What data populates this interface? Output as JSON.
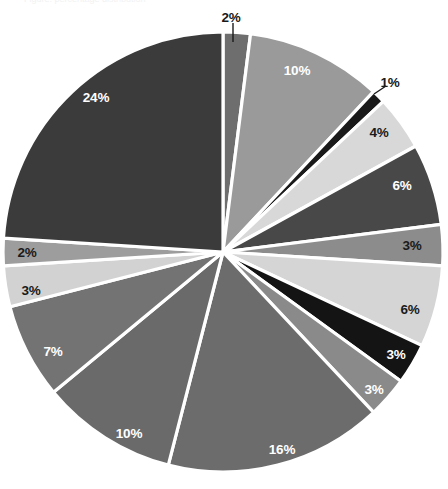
{
  "chart_data": {
    "type": "pie",
    "title": "",
    "subtitle": "",
    "xlabel": "",
    "ylabel": "",
    "legend": "none",
    "grid": false,
    "start_angle_deg": 0,
    "direction": "clockwise",
    "units": "percent",
    "total": 100,
    "center": {
      "x": 223,
      "y": 252
    },
    "radius": 220,
    "separator_color": "#ffffff",
    "background": "#ffffff",
    "categories": [
      "slice-1",
      "slice-2",
      "slice-3",
      "slice-4",
      "slice-5",
      "slice-6",
      "slice-7",
      "slice-8",
      "slice-9",
      "slice-10",
      "slice-11",
      "slice-12",
      "slice-13",
      "slice-14",
      "slice-15"
    ],
    "values": [
      2,
      10,
      1,
      4,
      6,
      3,
      6,
      3,
      3,
      16,
      10,
      7,
      3,
      2,
      24
    ],
    "labels": [
      "2%",
      "10%",
      "1%",
      "4%",
      "6%",
      "3%",
      "6%",
      "3%",
      "3%",
      "16%",
      "10%",
      "7%",
      "3%",
      "2%",
      "24%"
    ],
    "colors": [
      "#6e6e6e",
      "#9a9a9a",
      "#1a1a1a",
      "#d8d8d8",
      "#484848",
      "#8c8c8c",
      "#d5d5d5",
      "#141414",
      "#8a8a8a",
      "#6c6c6c",
      "#6a6a6a",
      "#737373",
      "#d2d2d2",
      "#9d9d9d",
      "#3b3b3b"
    ],
    "slices": [
      {
        "label": "2%",
        "value": 2,
        "color": "#6e6e6e",
        "label_placement": "outside",
        "label_pos": {
          "x": 231,
          "y": 18
        },
        "leader": {
          "x1": 233,
          "y1": 23,
          "x2": 233,
          "y2": 42
        },
        "label_color": "#1a1a1a"
      },
      {
        "label": "10%",
        "value": 10,
        "color": "#9a9a9a",
        "label_placement": "inside",
        "label_pos": {
          "x": 297,
          "y": 71
        },
        "label_color": "#ffffff"
      },
      {
        "label": "1%",
        "value": 1,
        "color": "#1a1a1a",
        "label_placement": "outside",
        "label_pos": {
          "x": 390,
          "y": 83
        },
        "leader": {
          "x1": 386,
          "y1": 86,
          "x2": 374,
          "y2": 94
        },
        "label_color": "#1a1a1a"
      },
      {
        "label": "4%",
        "value": 4,
        "color": "#d8d8d8",
        "label_placement": "inside",
        "label_pos": {
          "x": 379,
          "y": 133
        },
        "label_color": "#1a1a1a"
      },
      {
        "label": "6%",
        "value": 6,
        "color": "#484848",
        "label_placement": "inside",
        "label_pos": {
          "x": 402,
          "y": 186
        },
        "label_color": "#ffffff"
      },
      {
        "label": "3%",
        "value": 3,
        "color": "#8c8c8c",
        "label_placement": "inside",
        "label_pos": {
          "x": 412,
          "y": 246
        },
        "label_color": "#1a1a1a"
      },
      {
        "label": "6%",
        "value": 6,
        "color": "#d5d5d5",
        "label_placement": "inside",
        "label_pos": {
          "x": 410,
          "y": 310
        },
        "label_color": "#1a1a1a"
      },
      {
        "label": "3%",
        "value": 3,
        "color": "#141414",
        "label_placement": "inside",
        "label_pos": {
          "x": 396,
          "y": 355
        },
        "label_color": "#ffffff"
      },
      {
        "label": "3%",
        "value": 3,
        "color": "#8a8a8a",
        "label_placement": "inside",
        "label_pos": {
          "x": 374,
          "y": 390
        },
        "label_color": "#ffffff"
      },
      {
        "label": "16%",
        "value": 16,
        "color": "#6c6c6c",
        "label_placement": "inside",
        "label_pos": {
          "x": 282,
          "y": 450
        },
        "label_color": "#ffffff"
      },
      {
        "label": "10%",
        "value": 10,
        "color": "#6a6a6a",
        "label_placement": "inside",
        "label_pos": {
          "x": 129,
          "y": 434
        },
        "label_color": "#ffffff"
      },
      {
        "label": "7%",
        "value": 7,
        "color": "#737373",
        "label_placement": "inside",
        "label_pos": {
          "x": 53,
          "y": 352
        },
        "label_color": "#ffffff"
      },
      {
        "label": "3%",
        "value": 3,
        "color": "#d2d2d2",
        "label_placement": "inside",
        "label_pos": {
          "x": 31,
          "y": 291
        },
        "label_color": "#1a1a1a"
      },
      {
        "label": "2%",
        "value": 2,
        "color": "#9d9d9d",
        "label_placement": "inside",
        "label_pos": {
          "x": 27,
          "y": 253
        },
        "label_color": "#1a1a1a"
      },
      {
        "label": "24%",
        "value": 24,
        "color": "#3b3b3b",
        "label_placement": "inside",
        "label_pos": {
          "x": 96,
          "y": 98
        },
        "label_color": "#ffffff"
      }
    ]
  },
  "page": {
    "ghost_caption": "Figure: percentage distribution"
  }
}
